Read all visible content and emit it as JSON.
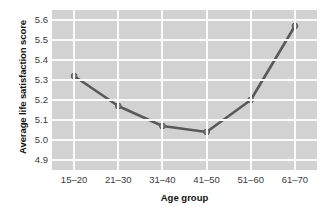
{
  "chart_data": {
    "type": "line",
    "title": "",
    "xlabel": "Age group",
    "ylabel": "Average life satisfaction score",
    "categories": [
      "15–20",
      "21–30",
      "31–40",
      "41–50",
      "51–60",
      "61–70"
    ],
    "values": [
      5.32,
      5.17,
      5.07,
      5.04,
      5.2,
      5.57
    ],
    "series": [
      {
        "name": "Average life satisfaction score",
        "values": [
          5.32,
          5.17,
          5.07,
          5.04,
          5.2,
          5.57
        ]
      }
    ],
    "ylim": [
      4.85,
      5.65
    ],
    "ytick_labels": [
      "5.6",
      "5.5",
      "5.4",
      "5.3",
      "5.2",
      "5.1",
      "5.0",
      "4.9"
    ],
    "ytick_values": [
      5.6,
      5.5,
      5.4,
      5.3,
      5.2,
      5.1,
      5.0,
      4.9
    ],
    "grid": true,
    "grid_color": "#fbfbfb",
    "legend": "none",
    "plot_background": "#d2d2d2",
    "figure_background": "#ffffff",
    "line_color": "#595959",
    "marker_color": "#7d7d7d",
    "marker_shape": "circle",
    "axis_label_color": "#3a3a3a",
    "axis_title_color": "#111111"
  }
}
